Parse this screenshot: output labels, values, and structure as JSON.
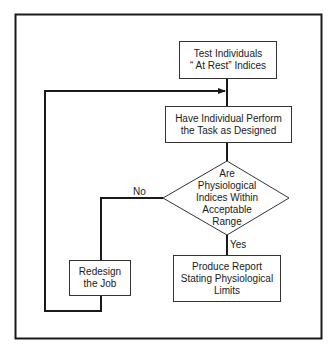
{
  "diagram": {
    "type": "flowchart",
    "nodes": {
      "test_rest": {
        "shape": "rectangle",
        "text": "Test Individuals\n“ At Rest” Indices"
      },
      "perform_task": {
        "shape": "rectangle",
        "text": "Have Individual Perform\nthe Task as Designed"
      },
      "decision": {
        "shape": "diamond",
        "text": "Are\nPhysiological\nIndices Within\nAcceptable\nRange"
      },
      "redesign": {
        "shape": "rectangle",
        "text": "Redesign\nthe Job"
      },
      "report": {
        "shape": "rectangle",
        "text": "Produce Report\nStating Physiological\nLimits"
      }
    },
    "edges": [
      {
        "from": "test_rest",
        "to": "perform_task",
        "label": ""
      },
      {
        "from": "perform_task",
        "to": "decision",
        "label": ""
      },
      {
        "from": "decision",
        "to": "report",
        "label": "Yes"
      },
      {
        "from": "decision",
        "to": "redesign",
        "label": "No"
      },
      {
        "from": "redesign",
        "to": "perform_task",
        "label": ""
      }
    ],
    "labels": {
      "yes": "Yes",
      "no": "No"
    }
  }
}
